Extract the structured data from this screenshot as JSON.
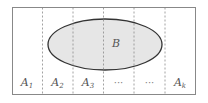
{
  "diagram": {
    "type": "set-partition",
    "frame": {
      "x": 12.5,
      "y": 7.5,
      "width": 183,
      "height": 87,
      "stroke": "#888888"
    },
    "dividers_x": [
      42.5,
      73,
      103.5,
      134,
      165
    ],
    "divider_color": "#8a8a8a",
    "ellipse": {
      "cx": 105,
      "cy": 44.5,
      "rx": 57,
      "ry": 25.5,
      "fill": "#e6e6e6",
      "stroke": "#333333",
      "label": "B",
      "label_x": 116,
      "label_y": 47
    },
    "partitions": [
      {
        "base": "A",
        "sub": "1",
        "x": 27
      },
      {
        "base": "A",
        "sub": "2",
        "x": 57.5
      },
      {
        "base": "A",
        "sub": "3",
        "x": 88
      },
      {
        "base": "",
        "sub": "",
        "text": "···",
        "x": 118.5
      },
      {
        "base": "",
        "sub": "",
        "text": "···",
        "x": 149.5
      },
      {
        "base": "A",
        "sub": "k",
        "x": 180
      }
    ],
    "partition_label_y": 86
  }
}
